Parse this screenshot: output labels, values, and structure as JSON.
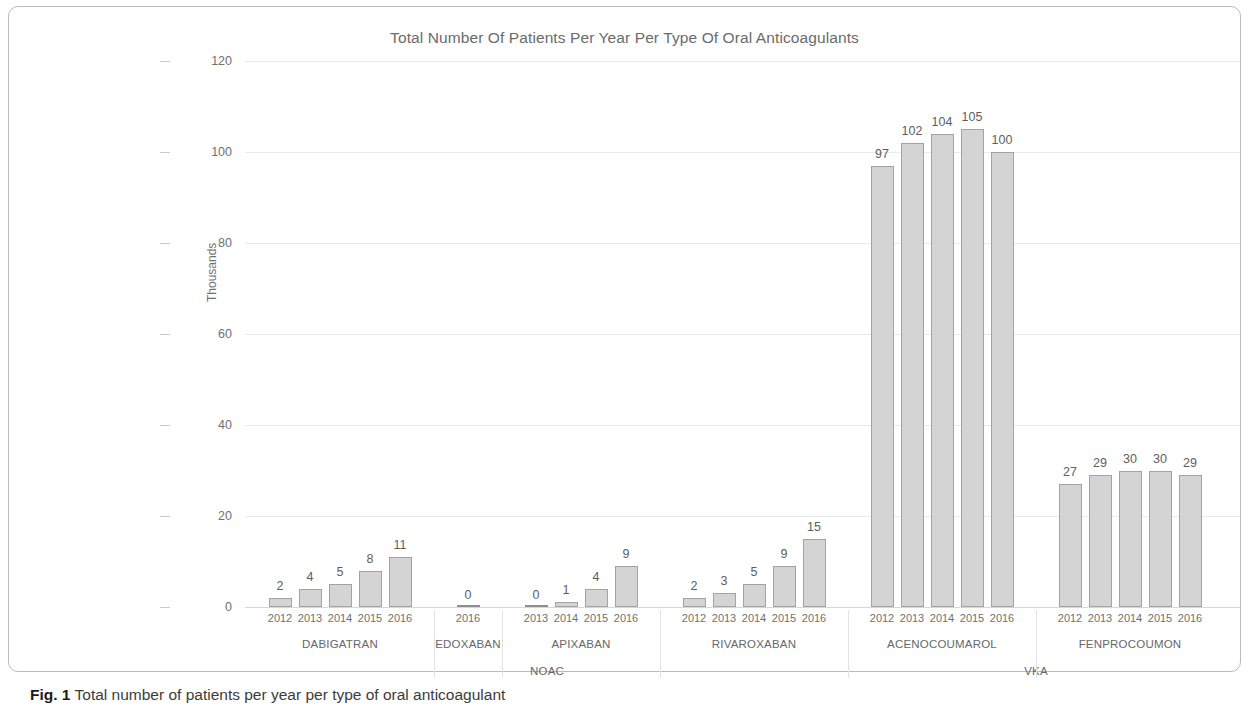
{
  "figure": {
    "caption_prefix": "Fig. 1",
    "caption_text": "Total number of patients per year per type of oral anticoagulant"
  },
  "chart_data": {
    "type": "bar",
    "title": "Total Number Of Patients Per Year Per Type Of Oral Anticoagulants",
    "xlabel": "",
    "ylabel": "Thousands",
    "ylim": [
      0,
      120
    ],
    "yticks": [
      0,
      20,
      40,
      60,
      80,
      100,
      120
    ],
    "grid": true,
    "legend": "none",
    "units": "thousands of patients",
    "groups": [
      {
        "drug": "DABIGATRAN",
        "class": "NOAC",
        "categories": [
          "2012",
          "2013",
          "2014",
          "2015",
          "2016"
        ],
        "values": [
          2,
          4,
          5,
          8,
          11
        ]
      },
      {
        "drug": "EDOXABAN",
        "class": "NOAC",
        "categories": [
          "2016"
        ],
        "values": [
          0
        ]
      },
      {
        "drug": "APIXABAN",
        "class": "NOAC",
        "categories": [
          "2013",
          "2014",
          "2015",
          "2016"
        ],
        "values": [
          0,
          1,
          4,
          9
        ]
      },
      {
        "drug": "RIVAROXABAN",
        "class": "NOAC",
        "categories": [
          "2012",
          "2013",
          "2014",
          "2015",
          "2016"
        ],
        "values": [
          2,
          3,
          5,
          9,
          15
        ]
      },
      {
        "drug": "ACENOCOUMAROL",
        "class": "VKA",
        "categories": [
          "2012",
          "2013",
          "2014",
          "2015",
          "2016"
        ],
        "values": [
          97,
          102,
          104,
          105,
          100
        ]
      },
      {
        "drug": "FENPROCOUMON",
        "class": "VKA",
        "categories": [
          "2012",
          "2013",
          "2014",
          "2015",
          "2016"
        ],
        "values": [
          27,
          29,
          30,
          30,
          29
        ]
      }
    ],
    "class_labels": [
      "NOAC",
      "VKA"
    ]
  },
  "colors": {
    "bar_fill": "#d4d4d4",
    "bar_stroke": "#a3a3a3",
    "text": "#6f7072",
    "grid": "#e9eaea",
    "frame": "#b9bbbd"
  }
}
